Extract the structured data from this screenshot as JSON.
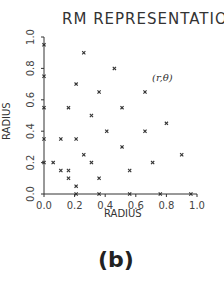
{
  "chart_data": {
    "type": "scatter",
    "title": "RM REPRESENTATION",
    "xlabel": "RADIUS",
    "ylabel": "RADIUS",
    "xlim": [
      0.0,
      1.0
    ],
    "ylim": [
      0.0,
      1.0
    ],
    "xticks": [
      "0.0",
      "0.2",
      "0.4",
      "0.6",
      "0.8",
      "1.0"
    ],
    "yticks": [
      "0.0",
      "0.2",
      "0.4",
      "0.6",
      "0.8",
      "1.0"
    ],
    "grid": false,
    "legend": null,
    "annotation": "(r,θ)",
    "panel_label": "(b)",
    "marker": "x",
    "points": [
      {
        "x": 0.0,
        "y": 0.95
      },
      {
        "x": 0.26,
        "y": 0.9
      },
      {
        "x": 0.46,
        "y": 0.8
      },
      {
        "x": 0.0,
        "y": 0.75
      },
      {
        "x": 0.21,
        "y": 0.7
      },
      {
        "x": 0.36,
        "y": 0.65
      },
      {
        "x": 0.66,
        "y": 0.65
      },
      {
        "x": 0.0,
        "y": 0.55
      },
      {
        "x": 0.16,
        "y": 0.55
      },
      {
        "x": 0.51,
        "y": 0.55
      },
      {
        "x": 0.31,
        "y": 0.5
      },
      {
        "x": 0.8,
        "y": 0.45
      },
      {
        "x": 0.41,
        "y": 0.4
      },
      {
        "x": 0.66,
        "y": 0.4
      },
      {
        "x": 0.0,
        "y": 0.35
      },
      {
        "x": 0.11,
        "y": 0.35
      },
      {
        "x": 0.21,
        "y": 0.35
      },
      {
        "x": 0.51,
        "y": 0.3
      },
      {
        "x": 0.26,
        "y": 0.25
      },
      {
        "x": 0.9,
        "y": 0.25
      },
      {
        "x": 0.0,
        "y": 0.2
      },
      {
        "x": 0.06,
        "y": 0.2
      },
      {
        "x": 0.31,
        "y": 0.2
      },
      {
        "x": 0.71,
        "y": 0.2
      },
      {
        "x": 0.11,
        "y": 0.15
      },
      {
        "x": 0.16,
        "y": 0.15
      },
      {
        "x": 0.56,
        "y": 0.15
      },
      {
        "x": 0.16,
        "y": 0.1
      },
      {
        "x": 0.36,
        "y": 0.1
      },
      {
        "x": 0.21,
        "y": 0.05
      },
      {
        "x": 0.21,
        "y": 0.0
      },
      {
        "x": 0.36,
        "y": 0.0
      },
      {
        "x": 0.56,
        "y": 0.0
      },
      {
        "x": 0.76,
        "y": 0.0
      },
      {
        "x": 0.96,
        "y": 0.0
      }
    ]
  }
}
